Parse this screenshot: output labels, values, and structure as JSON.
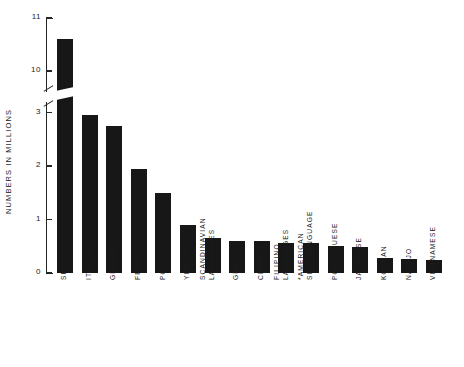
{
  "chart_data": {
    "type": "bar",
    "title": "",
    "subtitle": "",
    "xlabel": "",
    "ylabel": "NUMBERS IN MILLIONS",
    "orientation": "vertical",
    "grid": false,
    "legend": "none",
    "axis_break": {
      "present": true,
      "between": [
        3.2,
        9.6
      ],
      "note": "y-axis is broken between the 3 and 10 tick regions"
    },
    "ylim": [
      0,
      11
    ],
    "yticks": [
      0,
      1,
      2,
      3,
      10,
      11
    ],
    "ytick_labels": [
      "0",
      "1",
      "2",
      "3",
      "10",
      "11"
    ],
    "categories": [
      "SPANISH",
      "ITALIAN",
      "GERMAN",
      "FRENCH",
      "POLISH",
      "YIDDISH",
      "SCANDINAVIAN LANGUAGES",
      "GREEK",
      "CHINESE",
      "FILIPINO LANGUAGES",
      "*AMERICAN SIGN LANGUAGE",
      "PORTUGUESE",
      "JAPANESE",
      "KOREAN",
      "NAVAJO",
      "VIETNAMESE"
    ],
    "category_lines": [
      [
        "SPANISH"
      ],
      [
        "ITALIAN"
      ],
      [
        "GERMAN"
      ],
      [
        "FRENCH"
      ],
      [
        "POLISH"
      ],
      [
        "YIDDISH"
      ],
      [
        "SCANDINAVIAN",
        "LANGUAGES"
      ],
      [
        "GREEK"
      ],
      [
        "CHINESE"
      ],
      [
        "FILIPINO",
        "LANGUAGES"
      ],
      [
        "*AMERICAN",
        "SIGN LANGUAGE"
      ],
      [
        "PORTUGUESE"
      ],
      [
        "JAPANESE"
      ],
      [
        "KOREAN"
      ],
      [
        "NAVAJO"
      ],
      [
        "VIETNAMESE"
      ]
    ],
    "values": [
      10.6,
      2.95,
      2.75,
      1.95,
      1.5,
      0.9,
      0.65,
      0.6,
      0.6,
      0.55,
      0.55,
      0.5,
      0.48,
      0.27,
      0.25,
      0.24
    ],
    "units": "millions of speakers",
    "bar_color": "#171717"
  },
  "footnote": ""
}
